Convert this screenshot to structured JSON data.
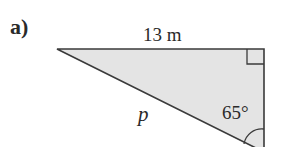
{
  "figure": {
    "part_label": "a)",
    "top_side_label": "13 m",
    "hypotenuse_label": "p",
    "angle_label": "65°",
    "right_angle_marker": true,
    "fill_color": "#e4e4e4",
    "stroke_color": "#3a3a3a"
  }
}
